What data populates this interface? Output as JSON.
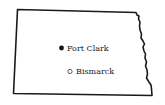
{
  "map": {
    "region": "North Dakota",
    "outline_color": "#1a1a1a",
    "background_color": "#ffffff",
    "places": [
      {
        "name": "Fort Clark",
        "marker": "filled-circle",
        "marker_color": "#111111"
      },
      {
        "name": "Bismarck",
        "marker": "open-circle",
        "marker_color": "#333333"
      }
    ]
  }
}
